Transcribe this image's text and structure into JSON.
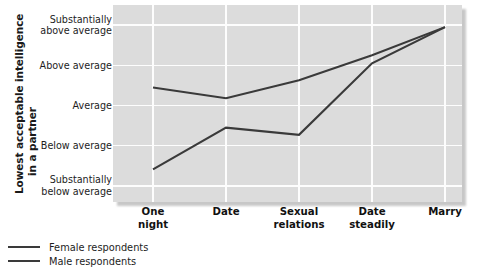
{
  "chart_data": {
    "type": "line",
    "title": "",
    "xlabel": "",
    "ylabel": "Lowest acceptable intelligence in a partner",
    "ylabel_line1": "Lowest acceptable intelligence",
    "ylabel_line2": "in a partner",
    "categories": [
      {
        "line1": "One",
        "line2": "night"
      },
      {
        "line1": "Date",
        "line2": ""
      },
      {
        "line1": "Sexual",
        "line2": "relations"
      },
      {
        "line1": "Date",
        "line2": "steadily"
      },
      {
        "line1": "Marry",
        "line2": ""
      }
    ],
    "ytick_labels": [
      {
        "line1": "Substantially",
        "line2": "above average",
        "value": 5
      },
      {
        "line1": "Above average",
        "line2": "",
        "value": 4
      },
      {
        "line1": "Average",
        "line2": "",
        "value": 3
      },
      {
        "line1": "Below average",
        "line2": "",
        "value": 2
      },
      {
        "line1": "Substantially",
        "line2": "below average",
        "value": 1
      }
    ],
    "ylim": [
      0.6,
      5.5
    ],
    "grid": true,
    "legend_position": "below-left",
    "series": [
      {
        "name": "Female respondents",
        "color": "#3a3a3a",
        "values": [
          3.45,
          3.18,
          3.63,
          4.25,
          4.95
        ]
      },
      {
        "name": "Male respondents",
        "color": "#3a3a3a",
        "values": [
          1.41,
          2.45,
          2.27,
          4.05,
          4.95
        ]
      }
    ]
  },
  "legend": {
    "items": [
      {
        "label": "Female respondents"
      },
      {
        "label": "Male respondents"
      }
    ]
  },
  "colors": {
    "plot_background": "#dcdcdc",
    "gridline": "#fdfdfd",
    "line": "#3a3a3a",
    "text": "#1a1a1a",
    "page_background": "#ffffff"
  }
}
